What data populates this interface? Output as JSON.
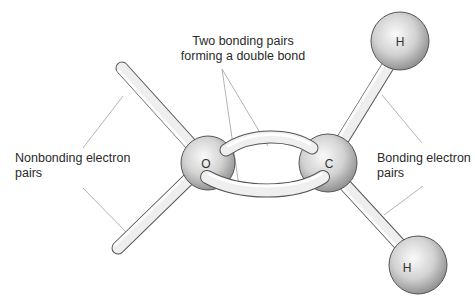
{
  "diagram": {
    "type": "molecular-model",
    "atoms": [
      {
        "id": "O",
        "label": "O",
        "cx": 208,
        "cy": 163,
        "r": 27
      },
      {
        "id": "C",
        "label": "C",
        "cx": 328,
        "cy": 163,
        "r": 29
      },
      {
        "id": "H1",
        "label": "H",
        "cx": 400,
        "cy": 41,
        "r": 29
      },
      {
        "id": "H2",
        "label": "H",
        "cx": 418,
        "cy": 265,
        "r": 29
      }
    ],
    "labels": {
      "double_bond_line1": "Two bonding pairs",
      "double_bond_line2": "forming a double bond",
      "nonbonding_line1": "Nonbonding electron",
      "nonbonding_line2": "pairs",
      "bonding_line1": "Bonding electron",
      "bonding_line2": "pairs"
    },
    "colors": {
      "atom_fill_light": "#f4f4f4",
      "atom_fill_dark": "#8f8f8f",
      "stroke": "#555555",
      "leader_line": "#9a9a9a",
      "text": "#2a2a2a"
    }
  }
}
